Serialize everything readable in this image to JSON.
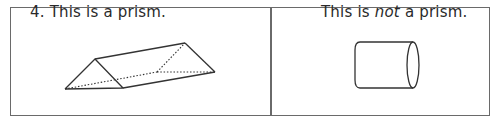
{
  "cells": [
    {
      "label": "4. This is a prism.",
      "figure": "triangular-prism"
    },
    {
      "label_parts": [
        "This is ",
        "not",
        " a prism."
      ],
      "figure": "cylinder"
    }
  ],
  "colors": {
    "line": "#333333",
    "border": "#6a6a6a"
  }
}
